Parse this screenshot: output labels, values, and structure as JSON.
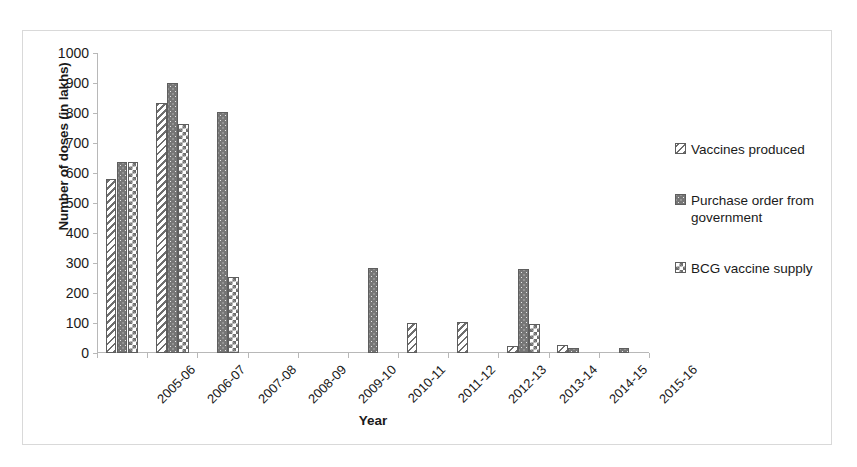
{
  "chart_data": {
    "type": "bar",
    "title": "",
    "xlabel": "Year",
    "ylabel": "Number of doses (in lakhs)",
    "ylim": [
      0,
      1000
    ],
    "y_ticks": [
      0,
      100,
      200,
      300,
      400,
      500,
      600,
      700,
      800,
      900,
      1000
    ],
    "grid": false,
    "legend_position": "right",
    "categories": [
      "2005-06",
      "2006-07",
      "2007-08",
      "2008-09",
      "2009-10",
      "2010-11",
      "2011-12",
      "2012-13",
      "2013-14",
      "2014-15",
      "2015-16"
    ],
    "series": [
      {
        "name": "Vaccines produced",
        "pattern": "diagonal-stripes",
        "color": "#6e6e6e",
        "values": [
          580,
          835,
          0,
          0,
          0,
          0,
          100,
          103,
          25,
          27,
          0
        ]
      },
      {
        "name": "Purchase order from government",
        "pattern": "solid-gray-dots",
        "color": "#767676",
        "values": [
          637,
          900,
          805,
          0,
          0,
          283,
          0,
          0,
          280,
          18,
          17
        ]
      },
      {
        "name": "BCG vaccine supply",
        "pattern": "checkerboard",
        "color": "#6e6e6e",
        "values": [
          637,
          763,
          253,
          0,
          0,
          0,
          0,
          0,
          98,
          0,
          0
        ]
      }
    ]
  },
  "legend": {
    "items": [
      {
        "label": "Vaccines produced",
        "swatch": "diagonal-stripes-swatch"
      },
      {
        "label": "Purchase order from government",
        "swatch": "solid-gray-dots-swatch"
      },
      {
        "label": "BCG vaccine supply",
        "swatch": "checkerboard-swatch"
      }
    ]
  },
  "axes": {
    "y_title": "Number of doses (in lakhs)",
    "x_title": "Year"
  }
}
